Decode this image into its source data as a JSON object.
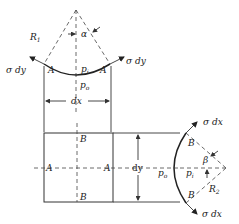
{
  "figure": {
    "top_view": {
      "radius_label": "R",
      "radius_sub": "1",
      "angle_label": "α",
      "point_left": "A",
      "point_right": "A",
      "inner_pressure": "p",
      "inner_pressure_sub": "i",
      "outer_pressure": "p",
      "outer_pressure_sub": "o",
      "force_left": "σ dy",
      "force_right": "σ dy",
      "width_label": "dx"
    },
    "front_view": {
      "top_label": "B",
      "bottom_label": "B",
      "left_label": "A",
      "right_label": "A",
      "height_label": "dy"
    },
    "side_view": {
      "point_top": "B",
      "point_bottom": "B",
      "angle_label": "β",
      "radius_label": "R",
      "radius_sub": "2",
      "outer_pressure": "p",
      "outer_pressure_sub": "o",
      "inner_pressure": "p",
      "inner_pressure_sub": "i",
      "force_top": "σ dx",
      "force_bottom": "σ dx"
    }
  }
}
